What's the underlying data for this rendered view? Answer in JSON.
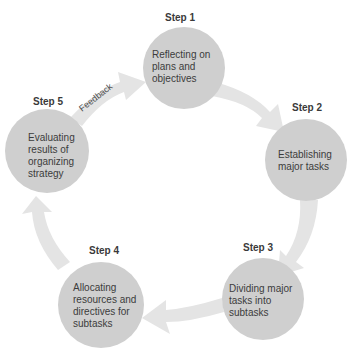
{
  "diagram": {
    "colors": {
      "circle_fill": "#cfcfcf",
      "arrow_fill": "#e4e4e4",
      "text": "#3c3c3c",
      "step_label": "#3a3a3a",
      "background": "#ffffff"
    },
    "steps": [
      {
        "label": "Step 1",
        "text": [
          "Reflecting on",
          "plans and",
          "objectives"
        ]
      },
      {
        "label": "Step 2",
        "text": [
          "Establishing",
          "major tasks"
        ]
      },
      {
        "label": "Step 3",
        "text": [
          "Dividing major",
          "tasks into",
          "subtasks"
        ]
      },
      {
        "label": "Step 4",
        "text": [
          "Allocating",
          "resources and",
          "directives for",
          "subtasks"
        ]
      },
      {
        "label": "Step 5",
        "text": [
          "Evaluating",
          "results of",
          "organizing",
          "strategy"
        ]
      }
    ],
    "feedback_label": "Feedback"
  }
}
